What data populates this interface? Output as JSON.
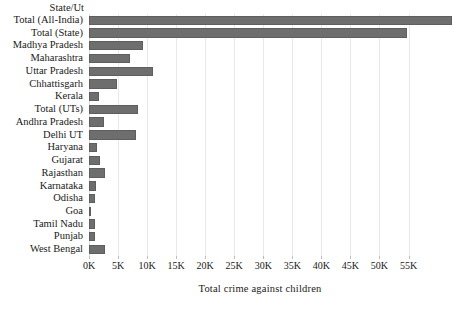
{
  "chart_data": {
    "type": "bar",
    "orientation": "horizontal",
    "title": "",
    "xlabel": "Total crime against children",
    "ylabel": "State/Ut",
    "categories": [
      "Total (All-India)",
      "Total (State)",
      "Madhya Pradesh",
      "Maharashtra",
      "Uttar Pradesh",
      "Chhattisgarh",
      "Kerala",
      "Total (UTs)",
      "Andhra Pradesh",
      "Delhi UT",
      "Haryana",
      "Gujarat",
      "Rajasthan",
      "Karnataka",
      "Odisha",
      "Goa",
      "Tamil Nadu",
      "Punjab",
      "West Bengal"
    ],
    "values": [
      62500,
      54700,
      9300,
      7100,
      11000,
      4800,
      1700,
      8400,
      2600,
      8100,
      1400,
      1900,
      2800,
      1200,
      1100,
      150,
      1100,
      1100,
      2700
    ],
    "xlim": [
      0,
      63000
    ],
    "xticks": [
      0,
      5000,
      10000,
      15000,
      20000,
      25000,
      30000,
      35000,
      40000,
      45000,
      50000,
      55000
    ],
    "xticklabels": [
      "0K",
      "5K",
      "10K",
      "15K",
      "20K",
      "25K",
      "30K",
      "35K",
      "40K",
      "45K",
      "50K",
      "55K"
    ],
    "grid": true,
    "legend": false,
    "bar_color": "#6e6e6e",
    "grid_color": "#e9e9e9",
    "background_color": "#ffffff"
  },
  "axis": {
    "y_header": "State/Ut",
    "x_title": "Total crime against children"
  }
}
